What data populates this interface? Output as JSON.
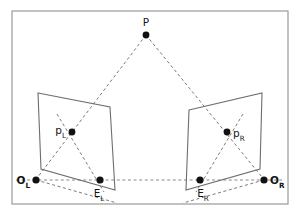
{
  "figure": {
    "background_color": "#ffffff",
    "frame": {
      "name": "figure-border",
      "x": 12,
      "y": 11,
      "width": 276,
      "height": 193,
      "stroke_color": "#9a9a9a"
    }
  },
  "colors": {
    "dot": "#111111",
    "label": "#141414",
    "plane_stroke": "#6e6e6e",
    "ray_stroke": "#7a7a7a",
    "baseline_stroke": "#8a8a8a",
    "frame_stroke": "#9a9a9a"
  },
  "planes": [
    {
      "name": "left-image-plane",
      "points": "38,93 110,107 115,190 41,169",
      "label": "left image plane"
    },
    {
      "name": "right-image-plane",
      "points": "189,110 262,93 260,169 186,190",
      "label": "right image plane"
    }
  ],
  "points": [
    {
      "id": "P",
      "name": "scene-point-P",
      "base": "P",
      "sub": "",
      "style": "plain",
      "dot_x": 146,
      "dot_y": 35,
      "dot_r": 3.4,
      "label_x": 146,
      "label_y": 26,
      "anchor": "middle"
    },
    {
      "id": "pL",
      "name": "left-image-point-pL",
      "base": "p",
      "sub": "L",
      "style": "plain",
      "dot_x": 72,
      "dot_y": 132,
      "dot_r": 3.4,
      "label_x": 66,
      "label_y": 134,
      "anchor": "end"
    },
    {
      "id": "pR",
      "name": "right-image-point-pR",
      "base": "p",
      "sub": "R",
      "style": "plain",
      "dot_x": 227,
      "dot_y": 132,
      "dot_r": 3.4,
      "label_x": 233,
      "label_y": 137,
      "anchor": "start"
    },
    {
      "id": "OL",
      "name": "left-camera-center-OL",
      "base": "O",
      "sub": "L",
      "style": "bold",
      "dot_x": 36,
      "dot_y": 180,
      "dot_r": 3.6,
      "label_x": 30,
      "label_y": 184,
      "anchor": "end"
    },
    {
      "id": "OR",
      "name": "right-camera-center-OR",
      "base": "O",
      "sub": "R",
      "style": "bold",
      "dot_x": 264,
      "dot_y": 180,
      "dot_r": 3.6,
      "label_x": 270,
      "label_y": 184,
      "anchor": "start"
    },
    {
      "id": "EL",
      "name": "left-epipole-EL",
      "base": "E",
      "sub": "L",
      "style": "plain",
      "dot_x": 100,
      "dot_y": 180,
      "dot_r": 3.6,
      "label_x": 99,
      "label_y": 197,
      "anchor": "middle"
    },
    {
      "id": "ER",
      "name": "right-epipole-ER",
      "base": "E",
      "sub": "R",
      "style": "plain",
      "dot_x": 200,
      "dot_y": 180,
      "dot_r": 3.6,
      "label_x": 203,
      "label_y": 197,
      "anchor": "middle"
    }
  ],
  "rays": [
    {
      "name": "ray-P-to-OL",
      "x1": 146,
      "y1": 35,
      "x2": 34,
      "y2": 182,
      "desc": "projection ray from scene point P to left camera center"
    },
    {
      "name": "ray-P-to-OR",
      "x1": 146,
      "y1": 35,
      "x2": 266,
      "y2": 182,
      "desc": "projection ray from scene point P to right camera center"
    },
    {
      "name": "ray-OL-to-EL-extended",
      "x1": 36,
      "y1": 180,
      "x2": 117,
      "y2": 203,
      "desc": "left baseline epipolar ray through left epipole"
    },
    {
      "name": "ray-OR-to-ER-extended",
      "x1": 264,
      "y1": 180,
      "x2": 183,
      "y2": 203,
      "desc": "right baseline epipolar ray through right epipole"
    },
    {
      "name": "epipolar-line-left-plane",
      "x1": 57,
      "y1": 114,
      "x2": 104,
      "y2": 192,
      "desc": "epipolar line in the left image plane through pL and EL"
    },
    {
      "name": "epipolar-line-right-plane",
      "x1": 243,
      "y1": 114,
      "x2": 196,
      "y2": 192,
      "desc": "epipolar line in the right image plane through pR and ER"
    }
  ],
  "baseline": {
    "name": "baseline-OL-OR",
    "x1": 16,
    "y1": 180,
    "x2": 285,
    "y2": 180,
    "desc": "stereo baseline joining the two camera centers"
  }
}
